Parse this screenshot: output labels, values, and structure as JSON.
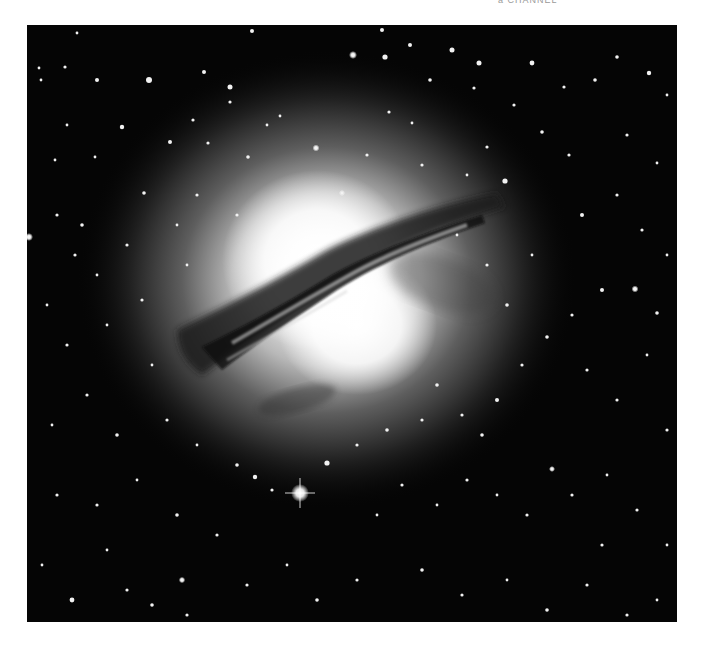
{
  "caption": {
    "text": "a  CHANNEL",
    "note": "partially cropped caption text at top edge"
  },
  "photo": {
    "subject": "galaxy-with-dust-lane",
    "description": "Grayscale astronomical image of a bright elliptical galaxy crossed by a dark diagonal dust lane, surrounded by a dense starfield",
    "colors": {
      "background": "#050505",
      "core": "#ffffff",
      "halo": "#8c8c8c",
      "dust": "#1a1a1a",
      "stars": "#f2f2f2"
    },
    "galaxy_center": {
      "x": 300,
      "y": 250
    },
    "bright_star": {
      "x": 273,
      "y": 468
    }
  }
}
